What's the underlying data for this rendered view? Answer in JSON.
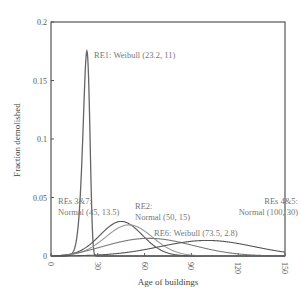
{
  "chart_data": {
    "type": "line",
    "title": "",
    "xlabel": "Age of buildings",
    "ylabel": "Fraction demolished",
    "xlim": [
      0,
      150
    ],
    "ylim": [
      0,
      0.2
    ],
    "xticks": [
      0,
      30,
      60,
      90,
      120,
      150
    ],
    "yticks": [
      0,
      0.05,
      0.1,
      0.15,
      0.2
    ],
    "ytick_labels": [
      "0",
      "0.05",
      "0.1",
      "0.15",
      "0.2"
    ],
    "grid": false,
    "legend": "inline annotations",
    "series": [
      {
        "name": "RE1: Weibull (23.2, 11)",
        "dist": "weibull",
        "scale": 23.2,
        "shape": 11,
        "color": "#666666",
        "width": 1.3
      },
      {
        "name": "REs 3&7: Normal (45, 13.5)",
        "dist": "normal",
        "mean": 45,
        "sd": 13.5,
        "color": "#555555",
        "width": 1.1
      },
      {
        "name": "RE2: Normal (50, 15)",
        "dist": "normal",
        "mean": 50,
        "sd": 15,
        "color": "#999999",
        "width": 1.1
      },
      {
        "name": "RE6: Weibull (73.5, 2.8)",
        "dist": "weibull",
        "scale": 73.5,
        "shape": 2.8,
        "color": "#7a7a7a",
        "width": 1.1
      },
      {
        "name": "REs 4&5: Normal (100, 30)",
        "dist": "normal",
        "mean": 100,
        "sd": 30,
        "color": "#555555",
        "width": 1.1
      }
    ],
    "annotations": [
      {
        "lines": [
          "RE1: Weibull (23.2, 11)"
        ],
        "x": 94,
        "y": 58
      },
      {
        "lines": [
          "REs 3&7:",
          "Normal (45, 13.5)"
        ],
        "x": 58,
        "y": 204
      },
      {
        "lines": [
          "RE2:",
          "Normal (50, 15)"
        ],
        "x": 135,
        "y": 209
      },
      {
        "lines": [
          "RE6: Weibull (73.5, 2.8)"
        ],
        "x": 154,
        "y": 236
      },
      {
        "lines": [
          "REs 4&5:",
          "Normal (100, 30)"
        ],
        "x": 298,
        "y": 204,
        "anchor": "end"
      }
    ]
  }
}
